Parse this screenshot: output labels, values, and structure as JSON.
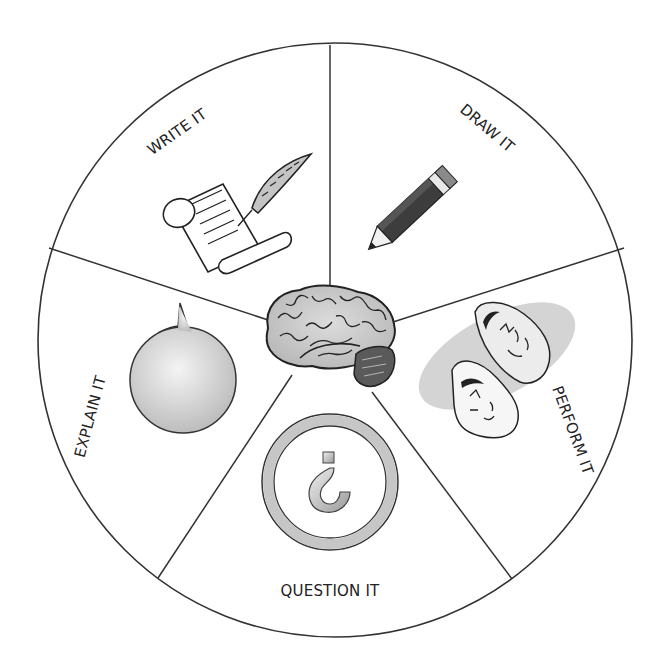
{
  "diagram": {
    "center": {
      "label": "Brain",
      "icon": "brain-icon"
    },
    "segments": [
      {
        "id": "write",
        "label": "WRITE IT",
        "icon": "scroll-quill-icon"
      },
      {
        "id": "draw",
        "label": "DRAW IT",
        "icon": "pencil-icon"
      },
      {
        "id": "perform",
        "label": "PERFORM IT",
        "icon": "theater-masks-icon"
      },
      {
        "id": "question",
        "label": "QUESTION IT",
        "icon": "question-mark-icon"
      },
      {
        "id": "explain",
        "label": "EXPLAIN IT",
        "icon": "speech-bubble-icon"
      }
    ],
    "colors": {
      "outline": "#333333",
      "fill_gray": "#c8c8c8",
      "light_gray": "#e2e2e2",
      "pencil_dark": "#3a3a3a"
    }
  }
}
